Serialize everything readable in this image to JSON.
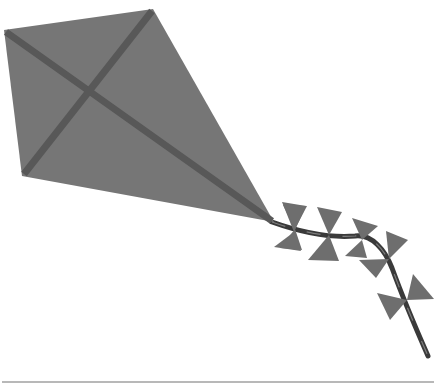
{
  "image": {
    "subject": "Paper kite with bow-tie tail",
    "colors": {
      "background": "#ffffff",
      "kite_sail": "#767676",
      "kite_spars": "#585858",
      "tail_bows": "#6e6e6e",
      "tail_ribbon": "#3a3a3a",
      "baseline": "#b8b8b8"
    },
    "kite": {
      "vertices": {
        "top_left": [
          4,
          30
        ],
        "top": [
          153,
          9
        ],
        "bottom_left": [
          22,
          176
        ],
        "bottom_right": [
          274,
          222
        ]
      }
    },
    "tail": {
      "bow_count": 5
    }
  }
}
